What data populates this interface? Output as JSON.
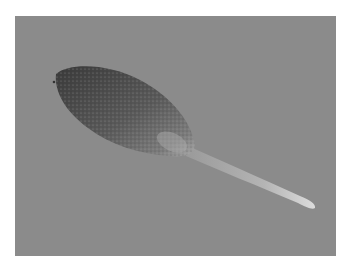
{
  "image": {
    "subject": "leaf-shaped seed with long tail on gray background",
    "colors": {
      "background": "#8b8b8b",
      "body_dark": "#3e3e3e",
      "body_mid": "#6a6a6a",
      "tail_light": "#c8c8c8"
    }
  }
}
